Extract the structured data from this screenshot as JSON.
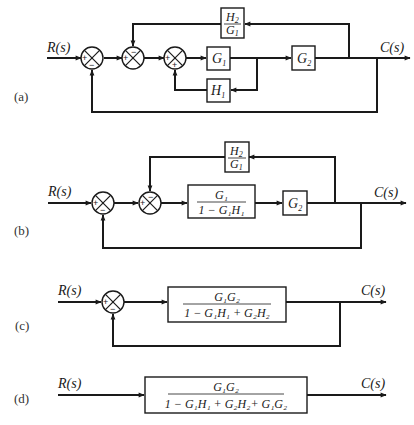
{
  "diagrams": {
    "a": {
      "label": "(a)",
      "input": "R(s)",
      "output": "C(s)",
      "summers": [
        {
          "signs": {
            "left": "+",
            "bottom": "−"
          }
        },
        {
          "signs": {
            "left": "+",
            "top": "−"
          }
        },
        {
          "signs": {
            "left": "+",
            "bottom": "+"
          }
        }
      ],
      "blocks": {
        "g1": {
          "main": "G",
          "sub": "1"
        },
        "g2": {
          "main": "G",
          "sub": "2"
        },
        "h1": {
          "main": "H",
          "sub": "1"
        },
        "h2_over_g1": {
          "num_main": "H",
          "num_sub": "2",
          "den_main": "G",
          "den_sub": "1"
        }
      }
    },
    "b": {
      "label": "(b)",
      "input": "R(s)",
      "output": "C(s)",
      "summers": [
        {
          "signs": {
            "left": "+",
            "bottom": "−"
          }
        },
        {
          "signs": {
            "left": "+",
            "top": "−"
          }
        }
      ],
      "blocks": {
        "inner_loop": {
          "numerator": "G₁",
          "denominator": "1 − G₁H₁"
        },
        "g2": {
          "main": "G",
          "sub": "2"
        },
        "h2_over_g1": {
          "num_main": "H",
          "num_sub": "2",
          "den_main": "G",
          "den_sub": "1"
        }
      }
    },
    "c": {
      "label": "(c)",
      "input": "R(s)",
      "output": "C(s)",
      "summers": [
        {
          "signs": {
            "left": "+",
            "bottom": "−"
          }
        }
      ],
      "blocks": {
        "forward": {
          "numerator": "G₁G₂",
          "denominator": "1 − G₁H₁ + G₂H₂"
        }
      }
    },
    "d": {
      "label": "(d)",
      "input": "R(s)",
      "output": "C(s)",
      "blocks": {
        "closed_loop": {
          "numerator": "G₁G₂",
          "denominator": "1 − G₁H₁ + G₂H₂+ G₁G₂"
        }
      }
    }
  }
}
